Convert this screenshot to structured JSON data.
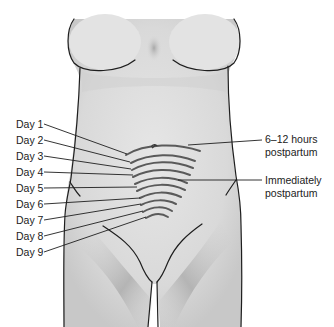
{
  "figure": {
    "colors": {
      "skin": "#dcdcdc",
      "skin_shadow": "#b9b9b9",
      "outline": "#1e1e1e",
      "arc": "#5a5a5a",
      "leader": "#1e1e1e",
      "text": "#222222"
    },
    "left_labels": [
      {
        "text": "Day 1",
        "y": 124
      },
      {
        "text": "Day 2",
        "y": 140
      },
      {
        "text": "Day 3",
        "y": 156
      },
      {
        "text": "Day 4",
        "y": 172
      },
      {
        "text": "Day 5",
        "y": 188
      },
      {
        "text": "Day 6",
        "y": 204
      },
      {
        "text": "Day 7",
        "y": 220
      },
      {
        "text": "Day 8",
        "y": 236
      },
      {
        "text": "Day 9",
        "y": 252
      }
    ],
    "right_labels": [
      {
        "line1": "6–12 hours",
        "line2": "postpartum"
      },
      {
        "line1": "Immediately",
        "line2": "postpartum"
      }
    ]
  }
}
